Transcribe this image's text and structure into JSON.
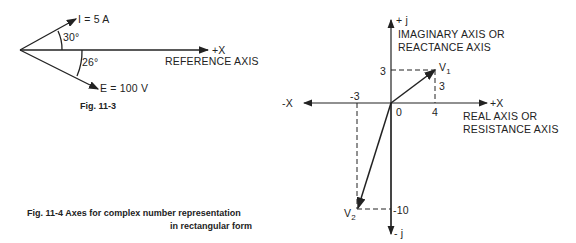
{
  "fig_11_3": {
    "current_label": "I = 5 A",
    "voltage_label": "E = 100 V",
    "angle_current": "30°",
    "angle_voltage": "26°",
    "axis_label": "+X",
    "reference_label": "REFERENCE AXIS",
    "caption": "Fig. 11-3"
  },
  "fig_11_4": {
    "pos_j": "+ j",
    "neg_j": "- j",
    "neg_x": "-X",
    "pos_x": "+X",
    "imag_axis_line1": "IMAGINARY AXIS OR",
    "imag_axis_line2": "REACTANCE AXIS",
    "real_axis_line1": "REAL AXIS OR",
    "real_axis_line2": "RESISTANCE AXIS",
    "v1": "V",
    "v1_sub": "1",
    "v2": "V",
    "v2_sub": "2",
    "tick_y3": "3",
    "tick_v1_height": "3",
    "tick_x4": "4",
    "tick_xm3": "-3",
    "tick_y_m10": "-10",
    "origin": "0",
    "caption_line1": "Fig. 11-4  Axes for complex number representation",
    "caption_line2": "in rectangular form"
  }
}
